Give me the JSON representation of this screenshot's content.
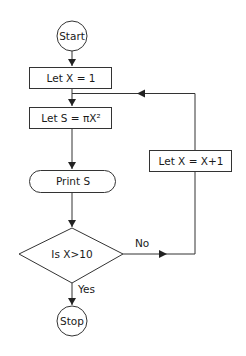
{
  "flowchart": {
    "nodes": {
      "start": {
        "label": "Start",
        "shape": "circle"
      },
      "init": {
        "label": "Let X = 1",
        "shape": "rectangle"
      },
      "compute": {
        "label": "Let S = πX²",
        "shape": "rectangle"
      },
      "print": {
        "label": "Print S",
        "shape": "rounded-rectangle"
      },
      "decision": {
        "label": "Is X>10",
        "shape": "diamond"
      },
      "increment": {
        "label": "Let X = X+1",
        "shape": "rectangle"
      },
      "stop": {
        "label": "Stop",
        "shape": "circle"
      }
    },
    "edges": {
      "no_label": "No",
      "yes_label": "Yes"
    }
  }
}
